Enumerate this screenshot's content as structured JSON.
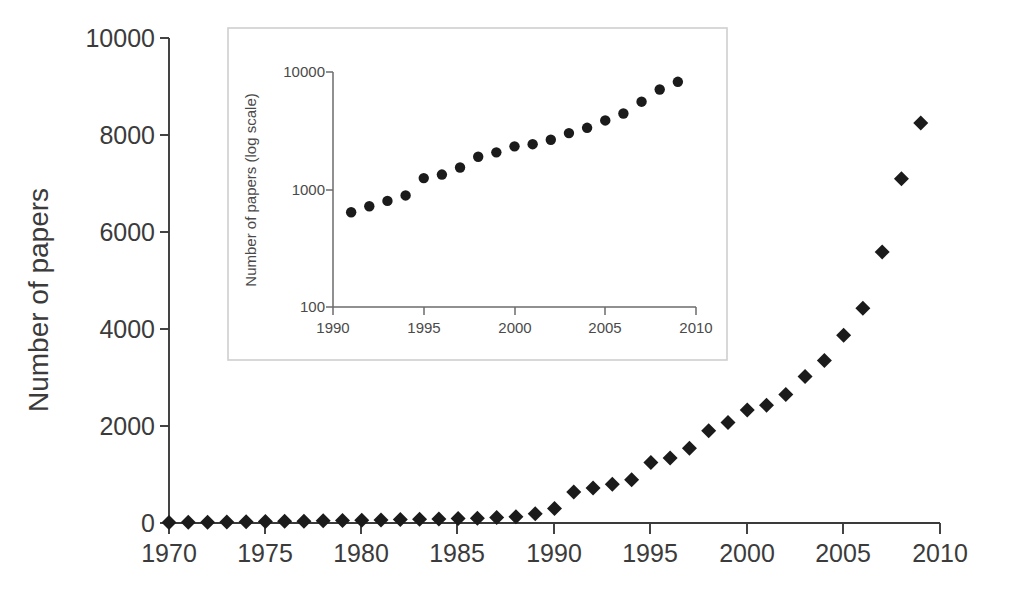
{
  "chart_data": {
    "type": "scatter",
    "title": "",
    "xlabel": "",
    "ylabel": "Number of papers",
    "xlim": [
      1970,
      2010
    ],
    "ylim": [
      0,
      10000
    ],
    "xticks": [
      1970,
      1975,
      1980,
      1985,
      1990,
      1995,
      2000,
      2005,
      2010
    ],
    "xtick_labels": [
      "1970",
      "1975",
      "1980",
      "1985",
      "1990",
      "1995",
      "2000",
      "2005",
      "2010"
    ],
    "yticks": [
      0,
      2000,
      4000,
      6000,
      8000,
      10000
    ],
    "ytick_labels": [
      "0",
      "2000",
      "4000",
      "6000",
      "8000",
      "10000"
    ],
    "grid": false,
    "legend": null,
    "marker": "diamond",
    "marker_color": "#1b1b1b",
    "x": [
      1970,
      1971,
      1972,
      1973,
      1974,
      1975,
      1976,
      1977,
      1978,
      1979,
      1980,
      1981,
      1982,
      1983,
      1984,
      1985,
      1986,
      1987,
      1988,
      1989,
      1990,
      1991,
      1992,
      1993,
      1994,
      1995,
      1996,
      1997,
      1998,
      1999,
      2000,
      2001,
      2002,
      2003,
      2004,
      2005,
      2006,
      2007,
      2008,
      2009
    ],
    "values": [
      12,
      15,
      18,
      22,
      26,
      30,
      34,
      38,
      44,
      50,
      58,
      64,
      70,
      76,
      84,
      92,
      100,
      112,
      130,
      190,
      300,
      640,
      720,
      800,
      890,
      1250,
      1340,
      1540,
      1900,
      2070,
      2330,
      2430,
      2650,
      3020,
      3350,
      3870,
      4430,
      5590,
      7100,
      8250
    ],
    "inset": {
      "type": "scatter",
      "title": "",
      "xlabel": "",
      "ylabel": "Number of papers (log scale)",
      "yscale": "log",
      "xlim": [
        1990,
        2010
      ],
      "ylim": [
        100,
        10000
      ],
      "xticks": [
        1990,
        1995,
        2000,
        2005,
        2010
      ],
      "xtick_labels": [
        "1990",
        "1995",
        "2000",
        "2005",
        "2010"
      ],
      "yticks": [
        100,
        1000,
        10000
      ],
      "ytick_labels": [
        "100",
        "1000",
        "10000"
      ],
      "grid": false,
      "marker": "circle",
      "marker_color": "#1b1b1b",
      "x": [
        1991,
        1992,
        1993,
        1994,
        1995,
        1996,
        1997,
        1998,
        1999,
        2000,
        2001,
        2002,
        2003,
        2004,
        2005,
        2006,
        2007,
        2008,
        2009
      ],
      "values": [
        640,
        720,
        800,
        890,
        1250,
        1340,
        1540,
        1900,
        2070,
        2330,
        2430,
        2650,
        3020,
        3350,
        3870,
        4430,
        5590,
        7100,
        8250
      ]
    }
  },
  "figure": {
    "background": "#ffffff",
    "main_axis_color": "#3a3a3a",
    "inset_axis_color": "#6b6b6b",
    "inset_frame_color": "#cfcfcf"
  }
}
